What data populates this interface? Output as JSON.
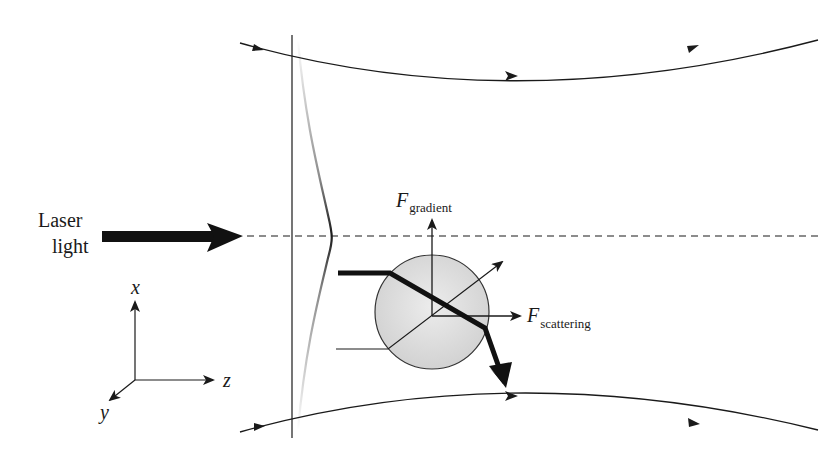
{
  "figure": {
    "laser_label": {
      "line1": "Laser",
      "line2": "light"
    },
    "forces": {
      "gradient": {
        "symbol": "F",
        "subscript": "gradient"
      },
      "scattering": {
        "symbol": "F",
        "subscript": "scattering"
      }
    },
    "axes": {
      "x": "x",
      "y": "y",
      "z": "z"
    },
    "colors": {
      "stroke": "#1a1a1a",
      "sphere_fill": "#dcdcdc",
      "sphere_stroke": "#333333",
      "background": "#ffffff"
    }
  }
}
